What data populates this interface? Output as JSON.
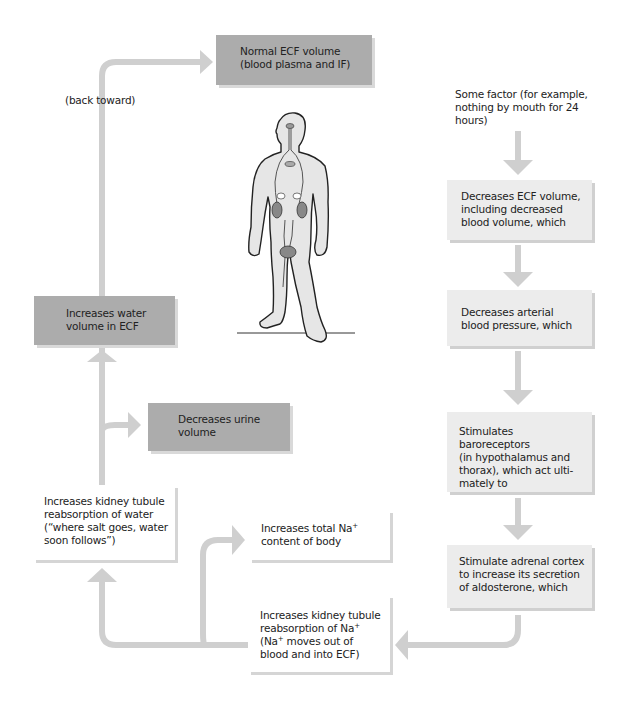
{
  "diagram": {
    "connector_color": "#cfcfcf",
    "colors": {
      "outcome_box": "#acacac",
      "step_box": "#ececec",
      "effect_box": "#ffffff"
    },
    "top_box": {
      "lines": [
        "Normal ECF volume",
        "(blood plasma and IF)"
      ]
    },
    "back_toward_label": "(back toward)",
    "trigger_text": {
      "lines": [
        "Some factor (for example,",
        "nothing by mouth for 24",
        "hours)"
      ]
    },
    "right_column": [
      {
        "id": "decreases-ecf",
        "lines": [
          "Decreases ECF volume,",
          "including decreased",
          "blood volume, which"
        ]
      },
      {
        "id": "decreases-pressure",
        "lines": [
          "Decreases arterial",
          "blood pressure, which"
        ]
      },
      {
        "id": "stimulates-baroreceptors",
        "lines": [
          "Stimulates baroreceptors",
          "(in hypothalamus and",
          "thorax), which act ulti-",
          "mately to"
        ]
      },
      {
        "id": "stimulate-adrenal",
        "lines": [
          "Stimulate adrenal cortex",
          "to increase its secretion",
          "of aldosterone, which"
        ]
      }
    ],
    "na_reabsorption_box": {
      "line1": "Increases kidney tubule",
      "line2_prefix": "reabsorption of Na",
      "line2_sup": "+",
      "line3_prefix": "(Na",
      "line3_sup": "+",
      "line3_suffix": " moves out of",
      "line4": "blood and into ECF)"
    },
    "total_na_box": {
      "line1_prefix": "Increases total Na",
      "line1_sup": "+",
      "line2": "content of body"
    },
    "water_reabsorption_box": {
      "lines": [
        "Increases kidney tubule",
        "reabsorption of water",
        "(“where salt goes, water",
        "soon follows”)"
      ]
    },
    "decreases_urine_box": {
      "lines": [
        "Decreases urine",
        "volume"
      ]
    },
    "increases_water_box": {
      "lines": [
        "Increases water",
        "volume in ECF"
      ]
    },
    "illustration": {
      "name": "human-body-figure",
      "highlighted_organs": [
        "hypothalamus",
        "heart/thorax",
        "adrenal glands",
        "kidneys",
        "bladder"
      ]
    }
  }
}
